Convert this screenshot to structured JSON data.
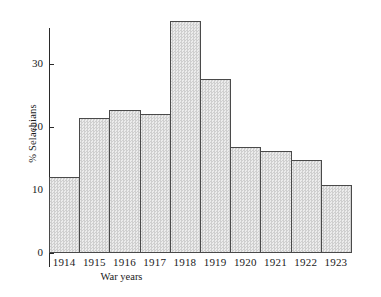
{
  "chart_data": {
    "type": "bar",
    "title": "",
    "xlabel": "War years",
    "ylabel": "% Selachians",
    "categories": [
      "1914",
      "1915",
      "1916",
      "1917",
      "1918",
      "1919",
      "1920",
      "1921",
      "1922",
      "1923"
    ],
    "values": [
      12.0,
      21.5,
      22.7,
      22.0,
      36.8,
      27.7,
      16.8,
      16.2,
      14.8,
      10.8
    ],
    "ylim": [
      0,
      38
    ],
    "yticks": [
      0,
      10,
      20,
      30
    ],
    "ytick_labels": [
      "0",
      "10",
      "20",
      "30"
    ],
    "grid": false,
    "legend": null,
    "bar_fill_color": "#dedede",
    "bar_edge_color": "#4a4a4a",
    "background_color": "#ffffff",
    "text_color": "#1a1a1a"
  }
}
